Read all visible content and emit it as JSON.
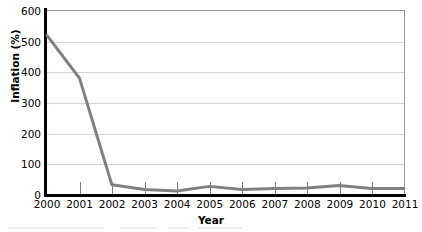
{
  "chart_data": {
    "type": "line",
    "title": "",
    "xlabel": "Year",
    "ylabel": "Inflation (%)",
    "categories": [
      "2000",
      "2001",
      "2002",
      "2003",
      "2004",
      "2005",
      "2006",
      "2007",
      "2008",
      "2009",
      "2010",
      "2011"
    ],
    "values": [
      520,
      380,
      30,
      15,
      10,
      25,
      15,
      18,
      20,
      28,
      18,
      18
    ],
    "series": [
      {
        "name": "Inflation",
        "values": [
          520,
          380,
          30,
          15,
          10,
          25,
          15,
          18,
          20,
          28,
          18,
          18
        ],
        "color": "#808080"
      }
    ],
    "ylim": [
      0,
      600
    ],
    "ytick_labels": [
      "0",
      "100",
      "200",
      "300",
      "400",
      "500",
      "600"
    ],
    "ytick_values": [
      0,
      100,
      200,
      300,
      400,
      500,
      600
    ],
    "grid": true,
    "legend": "none",
    "line_color": "#808080",
    "axis_color": "#000000",
    "gridline_color": "#d4d4d4"
  }
}
